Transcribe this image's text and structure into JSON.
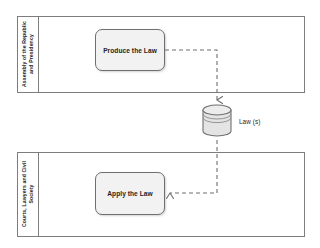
{
  "diagram": {
    "type": "bpmn-collaboration",
    "background_color": "#ffffff",
    "line_color": "#7d7d7d",
    "task_fill": "#f2f2f2",
    "task_border": "#6f6f6f",
    "datastore_fill": "#e8e8e8",
    "text_color": "#1f1f1f"
  },
  "pools": [
    {
      "id": "pool-legislative",
      "header_label": "Assembly of the Republic and Presidency",
      "header_lines": [
        "Assembly of the Republic",
        "and Presidency"
      ],
      "tasks": [
        {
          "id": "task-produce-the-law",
          "label": "Produce the Law"
        }
      ]
    },
    {
      "id": "pool-judicial",
      "header_label": "Courts, Lawyers and Civil Society",
      "header_lines": [
        "Courts, Lawyers and Civil",
        "Society"
      ],
      "tasks": [
        {
          "id": "task-apply-the-law",
          "label": "Apply the Law"
        }
      ]
    }
  ],
  "datastore": {
    "id": "datastore-laws",
    "label": "Law (s)"
  },
  "connectors": [
    {
      "id": "assoc-produce-to-laws",
      "style": "dashed",
      "from": "task-produce-the-law",
      "to": "datastore-laws",
      "arrowhead": "open"
    },
    {
      "id": "assoc-laws-to-apply",
      "style": "dashed",
      "from": "datastore-laws",
      "to": "task-apply-the-law",
      "arrowhead": "open"
    }
  ]
}
